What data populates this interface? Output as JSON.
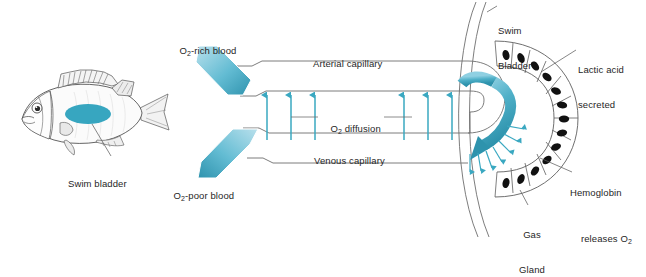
{
  "figure": {
    "background": "#ffffff",
    "accent_teal": "#3aa8c1",
    "accent_teal_dark": "#2e93ad",
    "accent_teal_light": "#9ad4e4",
    "line_color": "#6e6e6e",
    "text_color": "#262626"
  },
  "labels": {
    "swim_bladder_fish": "Swim bladder",
    "o2_rich_blood": {
      "pre": "O",
      "sub": "2",
      "post": "-rich blood"
    },
    "o2_poor_blood": {
      "pre": "O",
      "sub": "2",
      "post": "-poor blood"
    },
    "arterial_capillary": "Arterial capillary",
    "venous_capillary": "Venous capillary",
    "o2_diffusion": {
      "pre": "O",
      "sub": "2",
      "post": " diffusion"
    },
    "swim_bladder_line1": "Swim",
    "swim_bladder_line2": "Bladder",
    "lactic_acid_line1": "Lactic acid",
    "lactic_acid_line2": "secreted",
    "hemoglobin_line1": "Hemoglobin",
    "hemoglobin_line2_pre": "releases O",
    "hemoglobin_line2_sub": "2",
    "gas_gland_line1": "Gas",
    "gas_gland_line2": "Gland"
  },
  "diagram_data": {
    "type": "biological-schematic",
    "structures": [
      "fish body with swim bladder",
      "arterial capillary",
      "venous capillary",
      "capillary hairpin loop",
      "gas gland epithelium",
      "swim bladder wall"
    ],
    "diffusion_arrow_count_left": 3,
    "diffusion_arrow_count_right": 3,
    "diffusion_direction": "venous to arterial (upward)",
    "gas_gland_cell_count": 16,
    "radial_secretion_arrow_count": 7,
    "flow_arrows": [
      {
        "name": "inflow",
        "label": "O2-rich blood",
        "direction": "down-right"
      },
      {
        "name": "outflow",
        "label": "O2-poor blood",
        "direction": "down-left"
      },
      {
        "name": "loop",
        "label": "capillary loop flow",
        "direction": "clockwise"
      }
    ]
  }
}
